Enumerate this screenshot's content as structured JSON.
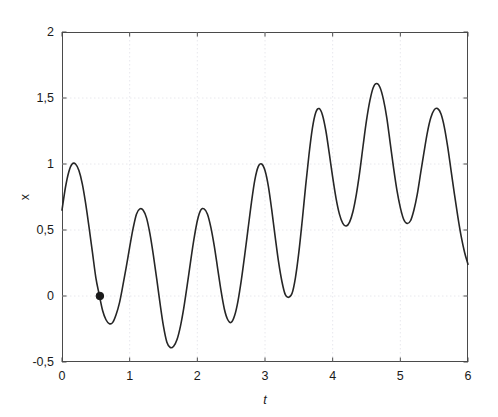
{
  "figure": {
    "background_color": "#ffffff",
    "axis_color": "#4a4a4a",
    "grid_color": "#e2e2e8",
    "line_color": "#262626",
    "marker_color": "#1a1a1a"
  },
  "chart_data": {
    "type": "line",
    "title": "",
    "xlabel": "t",
    "ylabel": "x",
    "xlim": [
      0,
      6
    ],
    "ylim": [
      -0.5,
      2
    ],
    "grid": true,
    "legend": null,
    "xticks": [
      0,
      1,
      2,
      3,
      4,
      5,
      6
    ],
    "xtick_labels": [
      "0",
      "1",
      "2",
      "3",
      "4",
      "5",
      "6"
    ],
    "yticks": [
      -0.5,
      0,
      0.5,
      1,
      1.5,
      2
    ],
    "ytick_labels": [
      "-0,5",
      "0",
      "0,5",
      "1",
      "1,5",
      "2"
    ],
    "decimal_separator": ",",
    "series": [
      {
        "name": "x(t)",
        "style": "solid",
        "width": 1.6,
        "x": [
          0.0,
          0.05,
          0.1,
          0.15,
          0.2,
          0.25,
          0.3,
          0.35,
          0.4,
          0.45,
          0.5,
          0.55,
          0.6,
          0.65,
          0.7,
          0.75,
          0.8,
          0.85,
          0.9,
          0.95,
          1.0,
          1.05,
          1.1,
          1.15,
          1.2,
          1.25,
          1.3,
          1.35,
          1.4,
          1.45,
          1.5,
          1.55,
          1.6,
          1.65,
          1.7,
          1.75,
          1.8,
          1.85,
          1.9,
          1.95,
          2.0,
          2.05,
          2.1,
          2.15,
          2.2,
          2.25,
          2.3,
          2.35,
          2.4,
          2.45,
          2.5,
          2.55,
          2.6,
          2.65,
          2.7,
          2.75,
          2.8,
          2.85,
          2.9,
          2.95,
          3.0,
          3.05,
          3.1,
          3.15,
          3.2,
          3.25,
          3.3,
          3.35,
          3.4,
          3.45,
          3.5,
          3.55,
          3.6,
          3.65,
          3.7,
          3.75,
          3.8,
          3.85,
          3.9,
          3.95,
          4.0,
          4.05,
          4.1,
          4.15,
          4.2,
          4.25,
          4.3,
          4.35,
          4.4,
          4.45,
          4.5,
          4.55,
          4.6,
          4.65,
          4.7,
          4.75,
          4.8,
          4.85,
          4.9,
          4.95,
          5.0,
          5.05,
          5.1,
          5.15,
          5.2,
          5.25,
          5.3,
          5.35,
          5.4,
          5.45,
          5.5,
          5.55,
          5.6,
          5.65,
          5.7,
          5.75,
          5.8,
          5.85,
          5.9,
          5.95,
          6.0
        ],
        "y": [
          0.65,
          0.82,
          0.94,
          1.0,
          1.0,
          0.95,
          0.85,
          0.7,
          0.52,
          0.33,
          0.14,
          0.01,
          -0.11,
          -0.18,
          -0.21,
          -0.2,
          -0.14,
          -0.05,
          0.08,
          0.22,
          0.37,
          0.51,
          0.62,
          0.66,
          0.65,
          0.59,
          0.47,
          0.31,
          0.13,
          -0.06,
          -0.23,
          -0.35,
          -0.39,
          -0.38,
          -0.33,
          -0.23,
          -0.09,
          0.08,
          0.26,
          0.43,
          0.57,
          0.65,
          0.66,
          0.62,
          0.52,
          0.38,
          0.21,
          0.04,
          -0.1,
          -0.18,
          -0.2,
          -0.15,
          -0.04,
          0.12,
          0.31,
          0.51,
          0.71,
          0.88,
          0.98,
          1.0,
          0.95,
          0.83,
          0.65,
          0.45,
          0.26,
          0.11,
          0.01,
          -0.01,
          0.02,
          0.14,
          0.33,
          0.57,
          0.83,
          1.07,
          1.27,
          1.39,
          1.42,
          1.37,
          1.25,
          1.08,
          0.9,
          0.74,
          0.62,
          0.55,
          0.53,
          0.56,
          0.64,
          0.77,
          0.94,
          1.14,
          1.33,
          1.48,
          1.58,
          1.61,
          1.58,
          1.49,
          1.35,
          1.16,
          0.97,
          0.8,
          0.67,
          0.58,
          0.55,
          0.57,
          0.65,
          0.77,
          0.93,
          1.09,
          1.24,
          1.35,
          1.41,
          1.42,
          1.38,
          1.28,
          1.13,
          0.95,
          0.77,
          0.6,
          0.45,
          0.33,
          0.24
        ]
      }
    ],
    "markers": [
      {
        "name": "zero-crossing-marker",
        "x": 0.56,
        "y": 0.0,
        "shape": "circle",
        "size": 5,
        "color": "#1a1a1a"
      }
    ]
  }
}
